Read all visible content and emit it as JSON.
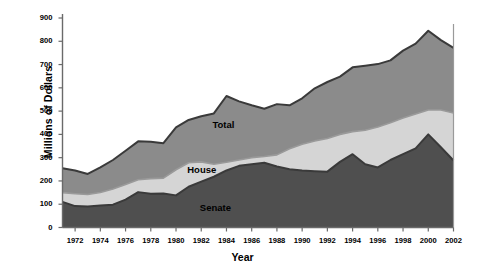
{
  "chart_data": {
    "type": "area",
    "title": "",
    "subtitle": "",
    "xlabel": "Year",
    "ylabel": "Millions of Dollars",
    "xlim": [
      1971,
      2002
    ],
    "ylim": [
      0,
      900
    ],
    "grid": false,
    "legend_position": "inline-annotations",
    "stacked": true,
    "x": [
      1971,
      1972,
      1973,
      1974,
      1975,
      1976,
      1977,
      1978,
      1979,
      1980,
      1981,
      1982,
      1983,
      1984,
      1985,
      1986,
      1987,
      1988,
      1989,
      1990,
      1991,
      1992,
      1993,
      1994,
      1995,
      1996,
      1997,
      1998,
      1999,
      2000,
      2001,
      2002
    ],
    "xtick_labels": [
      "1972",
      "1974",
      "1976",
      "1978",
      "1980",
      "1982",
      "1984",
      "1986",
      "1988",
      "1990",
      "1992",
      "1994",
      "1996",
      "1998",
      "2000",
      "2002"
    ],
    "xticks": [
      1972,
      1974,
      1976,
      1978,
      1980,
      1982,
      1984,
      1986,
      1988,
      1990,
      1992,
      1994,
      1996,
      1998,
      2000,
      2002
    ],
    "ytick_labels": [
      "0",
      "100",
      "200",
      "300",
      "400",
      "500",
      "600",
      "700",
      "800",
      "900"
    ],
    "yticks": [
      0,
      100,
      200,
      300,
      400,
      500,
      600,
      700,
      800,
      900
    ],
    "series": [
      {
        "name": "Senate",
        "color": "#4f4f4f",
        "values": [
          110,
          92,
          90,
          95,
          98,
          120,
          152,
          145,
          146,
          138,
          175,
          197,
          218,
          245,
          265,
          272,
          278,
          262,
          250,
          245,
          242,
          240,
          282,
          315,
          272,
          258,
          290,
          315,
          340,
          400,
          345,
          288
        ]
      },
      {
        "name": "House",
        "color": "#d5d5d5",
        "values": [
          150,
          145,
          142,
          150,
          165,
          185,
          205,
          210,
          212,
          248,
          278,
          282,
          272,
          280,
          290,
          300,
          305,
          312,
          338,
          358,
          372,
          382,
          400,
          412,
          418,
          432,
          450,
          470,
          488,
          505,
          505,
          492
        ]
      },
      {
        "name": "Total",
        "color": "#8b8b8b",
        "values": [
          255,
          245,
          230,
          258,
          290,
          330,
          370,
          368,
          362,
          430,
          462,
          478,
          490,
          565,
          542,
          525,
          510,
          530,
          525,
          555,
          598,
          625,
          648,
          688,
          695,
          702,
          718,
          760,
          790,
          845,
          805,
          772
        ]
      }
    ],
    "annotations": [
      {
        "text": "Total",
        "x": 1984,
        "y": 440
      },
      {
        "text": "House",
        "x": 1982,
        "y": 245
      },
      {
        "text": "Senate",
        "x": 1983,
        "y": 85
      }
    ]
  },
  "axis": {
    "axis_color": "#6a6a6a",
    "series_line_color": "#3a3a3a"
  }
}
